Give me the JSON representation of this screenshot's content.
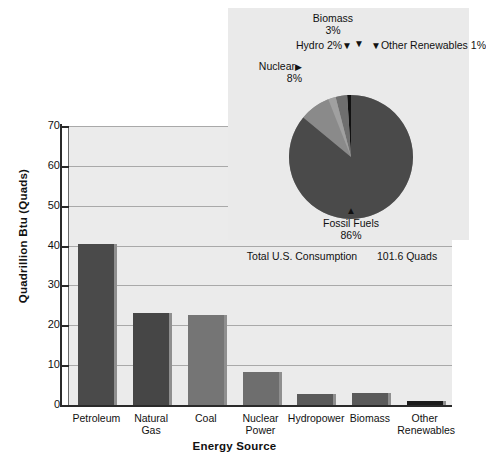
{
  "chart_data": {
    "type": "bar",
    "title": "",
    "xlabel": "Energy Source",
    "ylabel": "Quadrillion Btu (Quads)",
    "categories": [
      "Petroleum",
      "Natural Gas",
      "Coal",
      "Nuclear Power",
      "Hydropower",
      "Biomass",
      "Other Renewables"
    ],
    "values": [
      40.5,
      23.2,
      22.7,
      8.4,
      2.7,
      2.9,
      0.9
    ],
    "ylim": [
      0,
      70
    ],
    "yticks": [
      0,
      10,
      20,
      30,
      40,
      50,
      60,
      70
    ],
    "grid": true,
    "legend": "none",
    "bar_colors": [
      "#4a4a4a",
      "#464646",
      "#757575",
      "#6e6e6e",
      "#5a5a5a",
      "#5a5a5a",
      "#1c1c1c"
    ],
    "annotation": "Total U.S. Consumption    101.6 Quads",
    "inset": {
      "type": "pie",
      "labels": [
        "Fossil Fuels",
        "Nuclear",
        "Hydro",
        "Biomass",
        "Other Renewables"
      ],
      "values": [
        86,
        8,
        2,
        3,
        1
      ],
      "value_labels": [
        "86%",
        "8%",
        "2%",
        "3%",
        "1%"
      ],
      "colors": [
        "#4a4a4a",
        "#8a8a8a",
        "#a0a0a0",
        "#6f6f6f",
        "#111111"
      ]
    }
  },
  "axes": {
    "y_title": "Quadrillion Btu (Quads)",
    "x_title": "Energy Source",
    "y_ticks": [
      "70",
      "60",
      "50",
      "40",
      "30",
      "20",
      "10",
      "0"
    ]
  },
  "bars": [
    {
      "label_line1": "Petroleum",
      "label_line2": "",
      "value": 40.5,
      "color": "#4a4a4a"
    },
    {
      "label_line1": "Natural Gas",
      "label_line2": "",
      "value": 23.2,
      "color": "#464646"
    },
    {
      "label_line1": "Coal",
      "label_line2": "",
      "value": 22.7,
      "color": "#757575"
    },
    {
      "label_line1": "Nuclear",
      "label_line2": "Power",
      "value": 8.4,
      "color": "#6e6e6e"
    },
    {
      "label_line1": "Hydropower",
      "label_line2": "",
      "value": 2.7,
      "color": "#5a5a5a"
    },
    {
      "label_line1": "Biomass",
      "label_line2": "",
      "value": 2.9,
      "color": "#5a5a5a"
    },
    {
      "label_line1": "Other",
      "label_line2": "Renewables",
      "value": 0.9,
      "color": "#1c1c1c"
    }
  ],
  "pie": {
    "fossil_label": "Fossil Fuels",
    "fossil_value": "86%",
    "nuclear_label": "Nuclear",
    "nuclear_value": "8%",
    "hydro_label": "Hydro 2%",
    "biomass_label": "Biomass",
    "biomass_value": "3%",
    "other_label": "Other Renewables 1%",
    "marker_down": "▼",
    "marker_up": "▲",
    "marker_right": "▶"
  },
  "note": {
    "total_text": "Total U.S. Consumption",
    "total_value": "101.6 Quads"
  }
}
